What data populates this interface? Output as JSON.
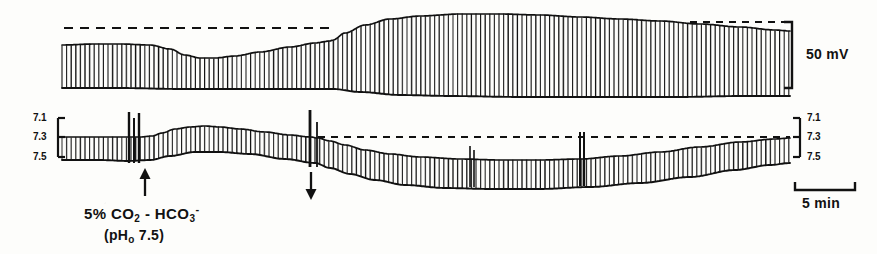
{
  "figure": {
    "kind": "electrophysiology-chart-recorder-trace",
    "background_color": "#fdfdfb",
    "ink_color": "#111111"
  },
  "annotations": {
    "vm_scale_label": "50 mV",
    "time_scale_label": "5 min",
    "treatment_line1_prefix": "5%  CO",
    "treatment_line1_sub1": "2",
    "treatment_line1_mid": " - HCO",
    "treatment_line1_sub2": "3",
    "treatment_line1_sup2": "-",
    "treatment_line2_prefix": "(pH",
    "treatment_line2_sub": "o",
    "treatment_line2_suffix": " 7.5)",
    "arrow_up_name": "treatment-onset-arrow",
    "arrow_down_name": "treatment-offset-arrow"
  },
  "axes": {
    "left_ticks": [
      "7.1",
      "7.3",
      "7.5"
    ],
    "right_ticks": [
      "7.1",
      "7.3",
      "7.5"
    ],
    "ph_axis_label_values": [
      7.1,
      7.3,
      7.5
    ]
  },
  "chart_data": {
    "type": "line",
    "title": "",
    "subtitle": "",
    "xlabel": "time",
    "ylabel": "",
    "grid": false,
    "legend_position": "none",
    "x_scale_bar": {
      "label": "5 min",
      "value": 5,
      "unit": "min",
      "x_start": 795,
      "x_end": 855,
      "y": 190
    },
    "panels": [
      {
        "name": "membrane-potential",
        "ylabel": "Vm",
        "y_scale_bar": {
          "label": "50 mV",
          "value": 50,
          "unit": "mV",
          "x": 792,
          "y_top": 22,
          "y_bottom": 88
        },
        "baseline_dashed_segments": [
          {
            "x_start": 64,
            "x_end": 332,
            "y": 28
          },
          {
            "x_start": 690,
            "x_end": 790,
            "y": 22
          }
        ],
        "trace_style": "dense-vertical-spike-envelope",
        "spike_spacing_px": 4.6,
        "envelope_top": [
          {
            "x": 62,
            "y": 45
          },
          {
            "x": 95,
            "y": 44
          },
          {
            "x": 120,
            "y": 44
          },
          {
            "x": 150,
            "y": 45
          },
          {
            "x": 170,
            "y": 49
          },
          {
            "x": 185,
            "y": 55
          },
          {
            "x": 200,
            "y": 58
          },
          {
            "x": 215,
            "y": 58
          },
          {
            "x": 235,
            "y": 56
          },
          {
            "x": 260,
            "y": 52
          },
          {
            "x": 290,
            "y": 47
          },
          {
            "x": 315,
            "y": 43
          },
          {
            "x": 330,
            "y": 41
          },
          {
            "x": 333,
            "y": 40
          },
          {
            "x": 345,
            "y": 33
          },
          {
            "x": 365,
            "y": 25
          },
          {
            "x": 390,
            "y": 19
          },
          {
            "x": 420,
            "y": 16
          },
          {
            "x": 460,
            "y": 14
          },
          {
            "x": 500,
            "y": 14
          },
          {
            "x": 540,
            "y": 15
          },
          {
            "x": 580,
            "y": 17
          },
          {
            "x": 620,
            "y": 19
          },
          {
            "x": 660,
            "y": 21
          },
          {
            "x": 700,
            "y": 24
          },
          {
            "x": 740,
            "y": 27
          },
          {
            "x": 775,
            "y": 30
          },
          {
            "x": 790,
            "y": 31
          }
        ],
        "envelope_bottom": [
          {
            "x": 62,
            "y": 88
          },
          {
            "x": 120,
            "y": 88
          },
          {
            "x": 180,
            "y": 89
          },
          {
            "x": 240,
            "y": 89
          },
          {
            "x": 300,
            "y": 89
          },
          {
            "x": 333,
            "y": 89
          },
          {
            "x": 360,
            "y": 92
          },
          {
            "x": 400,
            "y": 95
          },
          {
            "x": 450,
            "y": 96
          },
          {
            "x": 520,
            "y": 97
          },
          {
            "x": 600,
            "y": 97
          },
          {
            "x": 680,
            "y": 97
          },
          {
            "x": 740,
            "y": 96
          },
          {
            "x": 790,
            "y": 96
          }
        ]
      },
      {
        "name": "intracellular-ph",
        "ylabel": "pHi",
        "ph_value_at_7_1": 118,
        "ph_value_at_7_3": 137,
        "ph_value_at_7_5": 157,
        "baseline_dashed_segments": [
          {
            "x_start": 318,
            "x_end": 790,
            "y": 137
          }
        ],
        "trace_style": "dense-vertical-spike-envelope",
        "spike_spacing_px": 4.6,
        "envelope_top": [
          {
            "x": 62,
            "y": 137
          },
          {
            "x": 100,
            "y": 137
          },
          {
            "x": 128,
            "y": 137
          },
          {
            "x": 140,
            "y": 137
          },
          {
            "x": 152,
            "y": 136
          },
          {
            "x": 162,
            "y": 133
          },
          {
            "x": 175,
            "y": 129
          },
          {
            "x": 190,
            "y": 127
          },
          {
            "x": 205,
            "y": 126
          },
          {
            "x": 220,
            "y": 127
          },
          {
            "x": 240,
            "y": 129
          },
          {
            "x": 265,
            "y": 132
          },
          {
            "x": 290,
            "y": 135
          },
          {
            "x": 310,
            "y": 137
          },
          {
            "x": 318,
            "y": 138
          },
          {
            "x": 330,
            "y": 141
          },
          {
            "x": 345,
            "y": 145
          },
          {
            "x": 365,
            "y": 150
          },
          {
            "x": 390,
            "y": 154
          },
          {
            "x": 420,
            "y": 157
          },
          {
            "x": 460,
            "y": 159
          },
          {
            "x": 500,
            "y": 160
          },
          {
            "x": 540,
            "y": 160
          },
          {
            "x": 580,
            "y": 159
          },
          {
            "x": 620,
            "y": 156
          },
          {
            "x": 660,
            "y": 152
          },
          {
            "x": 700,
            "y": 147
          },
          {
            "x": 740,
            "y": 142
          },
          {
            "x": 775,
            "y": 139
          },
          {
            "x": 790,
            "y": 138
          }
        ],
        "envelope_bottom": [
          {
            "x": 62,
            "y": 160
          },
          {
            "x": 100,
            "y": 160
          },
          {
            "x": 128,
            "y": 161
          },
          {
            "x": 150,
            "y": 160
          },
          {
            "x": 170,
            "y": 156
          },
          {
            "x": 195,
            "y": 152
          },
          {
            "x": 220,
            "y": 152
          },
          {
            "x": 250,
            "y": 154
          },
          {
            "x": 285,
            "y": 159
          },
          {
            "x": 315,
            "y": 163
          },
          {
            "x": 330,
            "y": 168
          },
          {
            "x": 350,
            "y": 174
          },
          {
            "x": 375,
            "y": 180
          },
          {
            "x": 405,
            "y": 185
          },
          {
            "x": 445,
            "y": 188
          },
          {
            "x": 490,
            "y": 189
          },
          {
            "x": 540,
            "y": 189
          },
          {
            "x": 590,
            "y": 187
          },
          {
            "x": 640,
            "y": 183
          },
          {
            "x": 690,
            "y": 177
          },
          {
            "x": 735,
            "y": 170
          },
          {
            "x": 770,
            "y": 165
          },
          {
            "x": 790,
            "y": 163
          }
        ],
        "artifact_spikes": [
          {
            "x": 129,
            "y_top": 112,
            "y_bottom": 163,
            "width": 2.4
          },
          {
            "x": 134,
            "y_top": 118,
            "y_bottom": 163,
            "width": 2.0
          },
          {
            "x": 139,
            "y_top": 113,
            "y_bottom": 163,
            "width": 2.4
          },
          {
            "x": 310,
            "y_top": 110,
            "y_bottom": 167,
            "width": 2.8
          },
          {
            "x": 317,
            "y_top": 122,
            "y_bottom": 167,
            "width": 1.8
          },
          {
            "x": 470,
            "y_top": 146,
            "y_bottom": 187,
            "width": 1.6
          },
          {
            "x": 474,
            "y_top": 150,
            "y_bottom": 187,
            "width": 1.6
          },
          {
            "x": 580,
            "y_top": 132,
            "y_bottom": 186,
            "width": 2.0
          },
          {
            "x": 584,
            "y_top": 132,
            "y_bottom": 186,
            "width": 2.0
          }
        ]
      }
    ]
  }
}
